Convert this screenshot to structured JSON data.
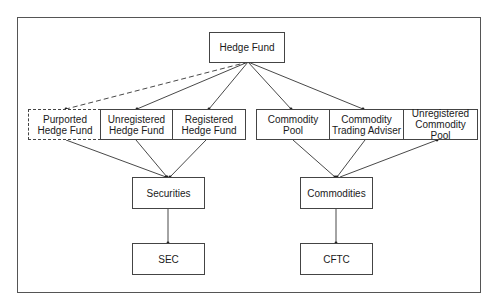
{
  "diagram": {
    "root": {
      "id": "hedge_fund",
      "label": "Hedge Fund"
    },
    "securities_group": {
      "entities": [
        {
          "id": "purported_hf",
          "label": "Purported\nHedge Fund",
          "style": "dashed"
        },
        {
          "id": "unregistered_hf",
          "label": "Unregistered\nHedge Fund",
          "style": "solid"
        },
        {
          "id": "registered_hf",
          "label": "Registered\nHedge Fund",
          "style": "solid"
        }
      ],
      "asset_class": {
        "id": "securities",
        "label": "Securities"
      },
      "regulator": {
        "id": "sec",
        "label": "SEC"
      }
    },
    "commodities_group": {
      "entities": [
        {
          "id": "commodity_pool",
          "label": "Commodity Pool",
          "style": "solid"
        },
        {
          "id": "cta",
          "label": "Commodity\nTrading Adviser",
          "style": "solid"
        },
        {
          "id": "unregistered_cp",
          "label": "Unregistered\nCommodity Pool",
          "style": "solid"
        }
      ],
      "asset_class": {
        "id": "commodities",
        "label": "Commodities"
      },
      "regulator": {
        "id": "cftc",
        "label": "CFTC"
      }
    },
    "edges": [
      {
        "from": "hedge_fund",
        "to": "purported_hf",
        "style": "dashed"
      },
      {
        "from": "hedge_fund",
        "to": "unregistered_hf",
        "style": "solid"
      },
      {
        "from": "hedge_fund",
        "to": "registered_hf",
        "style": "solid"
      },
      {
        "from": "hedge_fund",
        "to": "commodity_pool",
        "style": "solid"
      },
      {
        "from": "hedge_fund",
        "to": "cta",
        "style": "solid"
      },
      {
        "from": "purported_hf",
        "to": "securities",
        "style": "solid"
      },
      {
        "from": "unregistered_hf",
        "to": "securities",
        "style": "solid"
      },
      {
        "from": "registered_hf",
        "to": "securities",
        "style": "solid"
      },
      {
        "from": "commodity_pool",
        "to": "commodities",
        "style": "solid"
      },
      {
        "from": "cta",
        "to": "commodities",
        "style": "solid"
      },
      {
        "from": "commodities",
        "to": "unregistered_cp",
        "style": "solid"
      },
      {
        "from": "securities",
        "to": "sec",
        "style": "solid"
      },
      {
        "from": "commodities",
        "to": "cftc",
        "style": "solid"
      }
    ],
    "colors": {
      "line": "#333333",
      "border": "#444444",
      "background": "#ffffff"
    }
  }
}
